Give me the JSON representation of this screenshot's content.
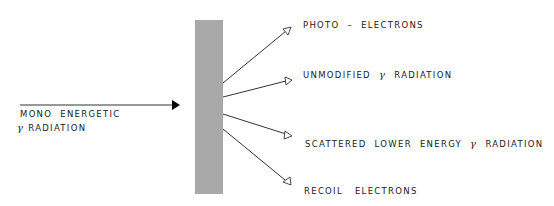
{
  "diagram": {
    "title": "",
    "input": {
      "line1": "MONO  ENERGETIC",
      "gamma": "γ",
      "line2": " RADIATION"
    },
    "absorber": {
      "color": "#a9a9a9"
    },
    "outputs": [
      {
        "pre": "PHOTO  –  ELECTRONS",
        "gamma": "",
        "post": ""
      },
      {
        "pre": "UNMODIFIED  ",
        "gamma": "γ",
        "post": "  RADIATION"
      },
      {
        "pre": "SCATTERED  LOWER  ENERGY  ",
        "gamma": "γ",
        "post": "  RADIATION"
      },
      {
        "pre": "RECOIL   ELECTRONS",
        "gamma": "",
        "post": ""
      }
    ]
  }
}
